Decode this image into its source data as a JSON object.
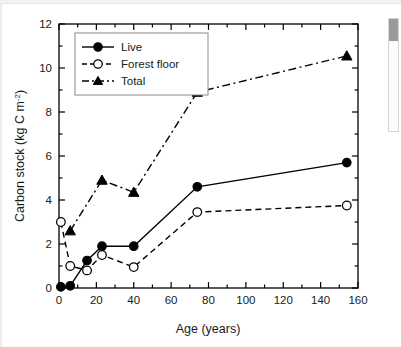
{
  "figure": {
    "background_color": "#ffffff",
    "line_color": "#000000"
  },
  "scrollbar": {
    "name": "vertical-scrollbar",
    "thumb_label": ""
  },
  "chart_data": {
    "type": "line",
    "title": "",
    "subtitle": "",
    "xlabel": "Age (years)",
    "ylabel_text": "Carbon stock (kg C m",
    "ylabel_sup": "-2",
    "ylabel_tail": ")",
    "ylabel_full": "Carbon stock (kg C m-2)",
    "xlim": [
      0,
      160
    ],
    "ylim": [
      0,
      12
    ],
    "xticks": [
      0,
      20,
      40,
      60,
      80,
      100,
      120,
      140,
      160
    ],
    "xtick_labels": [
      "0",
      "20",
      "40",
      "60",
      "80",
      "100",
      "120",
      "140",
      "160"
    ],
    "yticks": [
      0,
      2,
      4,
      6,
      8,
      10,
      12
    ],
    "ytick_labels": [
      "0",
      "2",
      "4",
      "6",
      "8",
      "10",
      "12"
    ],
    "x_minor_ticks": [
      10,
      30,
      50,
      70,
      90,
      110,
      130,
      150
    ],
    "y_minor_ticks": [
      1,
      3,
      5,
      7,
      9,
      11
    ],
    "grid": false,
    "legend_position": "upper left",
    "series": [
      {
        "name": "Live",
        "marker": "filled-circle",
        "linestyle": "solid",
        "x": [
          1,
          6,
          15,
          23,
          40,
          74,
          154
        ],
        "values": [
          0.05,
          0.1,
          1.25,
          1.9,
          1.9,
          4.6,
          5.7
        ]
      },
      {
        "name": "Forest floor",
        "marker": "open-circle",
        "linestyle": "dashed",
        "x": [
          1,
          6,
          15,
          23,
          40,
          74,
          154
        ],
        "values": [
          3.0,
          1.0,
          0.8,
          1.5,
          0.95,
          3.45,
          3.75
        ]
      },
      {
        "name": "Total",
        "marker": "filled-triangle",
        "linestyle": "dash-dot",
        "x": [
          6,
          23,
          40,
          74,
          154
        ],
        "values": [
          2.6,
          4.9,
          4.35,
          8.9,
          10.55
        ]
      }
    ]
  },
  "legend": {
    "entries": [
      {
        "label": "Live"
      },
      {
        "label": "Forest floor"
      },
      {
        "label": "Total"
      }
    ]
  }
}
